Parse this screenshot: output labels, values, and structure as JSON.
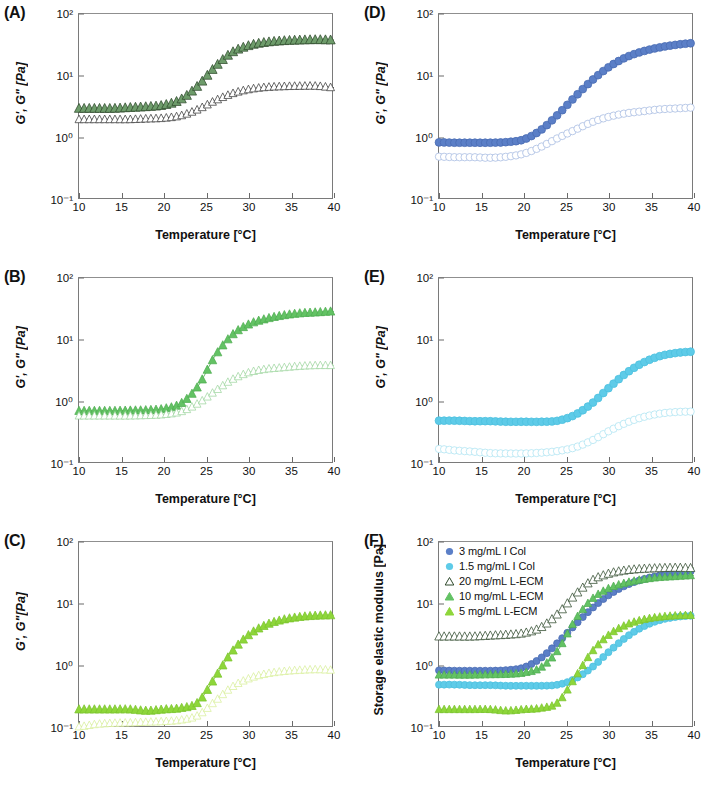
{
  "figure": {
    "axis": {
      "xlabel": "Temperature [°C]",
      "xticks": [
        "10",
        "15",
        "20",
        "25",
        "30",
        "35",
        "40"
      ],
      "yticks": [
        "10²",
        "10¹",
        "10⁰",
        "10⁻¹"
      ],
      "xlim": [
        10,
        40
      ],
      "ylim": [
        0.1,
        100
      ]
    },
    "colors": {
      "dark_green": "#6e9c6b",
      "dark_green_line": "#2f4a2c",
      "mid_green": "#63c264",
      "mid_green_open": "#9fd6a0",
      "light_green": "#8ed63a",
      "light_green_open": "#d8ef9b",
      "blue": "#5b7fc7",
      "blue_open": "#a8bde2",
      "cyan": "#5ecbe8",
      "cyan_open": "#b0e5f3"
    },
    "panels": [
      {
        "id": "A",
        "label": "(A)",
        "ylabel": "G', G\" [Pa]",
        "series": [
          {
            "name": "G-prime",
            "marker": "triangle-filled",
            "color_key": "dark_green"
          },
          {
            "name": "G-double-prime",
            "marker": "triangle-open",
            "color_key": "dark_green_line"
          }
        ]
      },
      {
        "id": "B",
        "label": "(B)",
        "ylabel": "G', G\" [Pa]",
        "series": [
          {
            "name": "G-prime",
            "marker": "triangle-filled",
            "color_key": "mid_green"
          },
          {
            "name": "G-double-prime",
            "marker": "triangle-open",
            "color_key": "mid_green_open"
          }
        ]
      },
      {
        "id": "C",
        "label": "(C)",
        "ylabel": "G', G\"[Pa]",
        "series": [
          {
            "name": "G-prime",
            "marker": "triangle-filled",
            "color_key": "light_green"
          },
          {
            "name": "G-double-prime",
            "marker": "triangle-open",
            "color_key": "light_green_open"
          }
        ]
      },
      {
        "id": "D",
        "label": "(D)",
        "ylabel": "G', G\" [Pa]",
        "series": [
          {
            "name": "G-prime",
            "marker": "circle-filled",
            "color_key": "blue"
          },
          {
            "name": "G-double-prime",
            "marker": "circle-open",
            "color_key": "blue_open"
          }
        ]
      },
      {
        "id": "E",
        "label": "(E)",
        "ylabel": "G', G\" [Pa]",
        "series": [
          {
            "name": "G-prime",
            "marker": "circle-filled",
            "color_key": "cyan"
          },
          {
            "name": "G-double-prime",
            "marker": "circle-open",
            "color_key": "cyan_open"
          }
        ]
      },
      {
        "id": "F",
        "label": "(F)",
        "ylabel": "Storage elastic modulus [Pa]",
        "legend": [
          {
            "label": "3 mg/mL I Col",
            "marker": "circle-filled",
            "color_key": "blue"
          },
          {
            "label": "1.5 mg/mL I Col",
            "marker": "circle-filled",
            "color_key": "cyan"
          },
          {
            "label": "20 mg/mL L-ECM",
            "marker": "triangle-open",
            "color_key": "dark_green"
          },
          {
            "label": "10 mg/mL L-ECM",
            "marker": "triangle-filled",
            "color_key": "mid_green"
          },
          {
            "label": "5 mg/mL L-ECM",
            "marker": "triangle-filled",
            "color_key": "light_green"
          }
        ]
      }
    ]
  },
  "chart_data": {
    "type": "line",
    "title": "",
    "xlabel": "Temperature [°C]",
    "ylabel": "G', G\" [Pa]",
    "xlim": [
      10,
      40
    ],
    "ylim": [
      0.1,
      100
    ],
    "yscale": "log",
    "grid": false,
    "legend_position": "inside-top-left (panel F)",
    "x": [
      10,
      12,
      14,
      16,
      18,
      20,
      22,
      24,
      26,
      28,
      30,
      32,
      34,
      36,
      38,
      40
    ],
    "panels": [
      {
        "panel": "A",
        "description": "20 mg/mL L-ECM",
        "series": [
          {
            "name": "G' (storage)",
            "values": [
              3.0,
              3.0,
              3.0,
              3.1,
              3.2,
              3.4,
              4.2,
              7.0,
              14.0,
              24.0,
              31.0,
              35.0,
              37.0,
              38.0,
              38.5,
              38.0
            ]
          },
          {
            "name": "G\" (loss)",
            "values": [
              2.0,
              2.0,
              2.0,
              2.0,
              2.05,
              2.1,
              2.3,
              2.9,
              4.0,
              5.2,
              6.1,
              6.6,
              6.8,
              6.9,
              6.9,
              6.5
            ]
          }
        ]
      },
      {
        "panel": "B",
        "description": "10 mg/mL L-ECM",
        "series": [
          {
            "name": "G' (storage)",
            "values": [
              0.72,
              0.72,
              0.72,
              0.73,
              0.74,
              0.78,
              0.95,
              1.8,
              5.5,
              12.0,
              18.0,
              22.0,
              25.0,
              27.0,
              28.0,
              29.0
            ]
          },
          {
            "name": "G\" (loss)",
            "values": [
              0.6,
              0.6,
              0.6,
              0.6,
              0.61,
              0.63,
              0.7,
              0.95,
              1.5,
              2.3,
              3.0,
              3.4,
              3.6,
              3.8,
              3.9,
              3.9
            ]
          }
        ]
      },
      {
        "panel": "C",
        "description": "5 mg/mL L-ECM",
        "series": [
          {
            "name": "G' (storage)",
            "values": [
              0.2,
              0.2,
              0.2,
              0.2,
              0.19,
              0.2,
              0.21,
              0.26,
              0.65,
              1.7,
              3.2,
              4.6,
              5.6,
              6.2,
              6.5,
              6.6
            ]
          },
          {
            "name": "G\" (loss)",
            "values": [
              0.105,
              0.115,
              0.12,
              0.122,
              0.125,
              0.128,
              0.135,
              0.16,
              0.27,
              0.46,
              0.63,
              0.75,
              0.82,
              0.86,
              0.88,
              0.86
            ]
          }
        ]
      },
      {
        "panel": "D",
        "description": "3 mg/mL I Col",
        "series": [
          {
            "name": "G' (storage)",
            "values": [
              0.85,
              0.84,
              0.84,
              0.84,
              0.86,
              0.95,
              1.35,
              2.4,
              4.6,
              8.5,
              14.0,
              20.0,
              25.0,
              29.0,
              32.0,
              34.0
            ]
          },
          {
            "name": "G\" (loss)",
            "values": [
              0.5,
              0.49,
              0.49,
              0.48,
              0.5,
              0.56,
              0.72,
              1.0,
              1.35,
              1.8,
              2.2,
              2.5,
              2.7,
              2.9,
              3.0,
              3.1
            ]
          }
        ]
      },
      {
        "panel": "E",
        "description": "1.5 mg/mL I Col",
        "series": [
          {
            "name": "G' (storage)",
            "values": [
              0.5,
              0.5,
              0.49,
              0.49,
              0.48,
              0.48,
              0.48,
              0.5,
              0.62,
              0.95,
              1.7,
              2.9,
              4.3,
              5.5,
              6.2,
              6.5
            ]
          },
          {
            "name": "G\" (loss)",
            "values": [
              0.175,
              0.165,
              0.158,
              0.15,
              0.148,
              0.148,
              0.152,
              0.162,
              0.185,
              0.24,
              0.34,
              0.46,
              0.57,
              0.65,
              0.69,
              0.7
            ]
          }
        ]
      },
      {
        "panel": "F",
        "description": "Storage elastic modulus, all formulations overlaid",
        "series": [
          {
            "name": "3 mg/mL I Col",
            "values": [
              0.85,
              0.84,
              0.84,
              0.84,
              0.86,
              0.95,
              1.35,
              2.4,
              4.6,
              8.5,
              14.0,
              20.0,
              25.0,
              29.0,
              32.0,
              34.0
            ]
          },
          {
            "name": "1.5 mg/mL I Col",
            "values": [
              0.5,
              0.5,
              0.49,
              0.49,
              0.48,
              0.48,
              0.48,
              0.5,
              0.62,
              0.95,
              1.7,
              2.9,
              4.3,
              5.5,
              6.2,
              6.5
            ]
          },
          {
            "name": "20 mg/mL L-ECM",
            "values": [
              3.0,
              3.0,
              3.0,
              3.1,
              3.2,
              3.4,
              4.2,
              7.0,
              14.0,
              24.0,
              31.0,
              35.0,
              37.0,
              38.0,
              38.5,
              38.0
            ]
          },
          {
            "name": "10 mg/mL L-ECM",
            "values": [
              0.72,
              0.72,
              0.72,
              0.73,
              0.74,
              0.78,
              0.95,
              1.8,
              5.5,
              12.0,
              18.0,
              22.0,
              25.0,
              27.0,
              28.0,
              29.0
            ]
          },
          {
            "name": "5 mg/mL L-ECM",
            "values": [
              0.2,
              0.2,
              0.2,
              0.2,
              0.19,
              0.2,
              0.21,
              0.26,
              0.65,
              1.7,
              3.2,
              4.6,
              5.6,
              6.2,
              6.5,
              6.6
            ]
          }
        ]
      }
    ]
  }
}
